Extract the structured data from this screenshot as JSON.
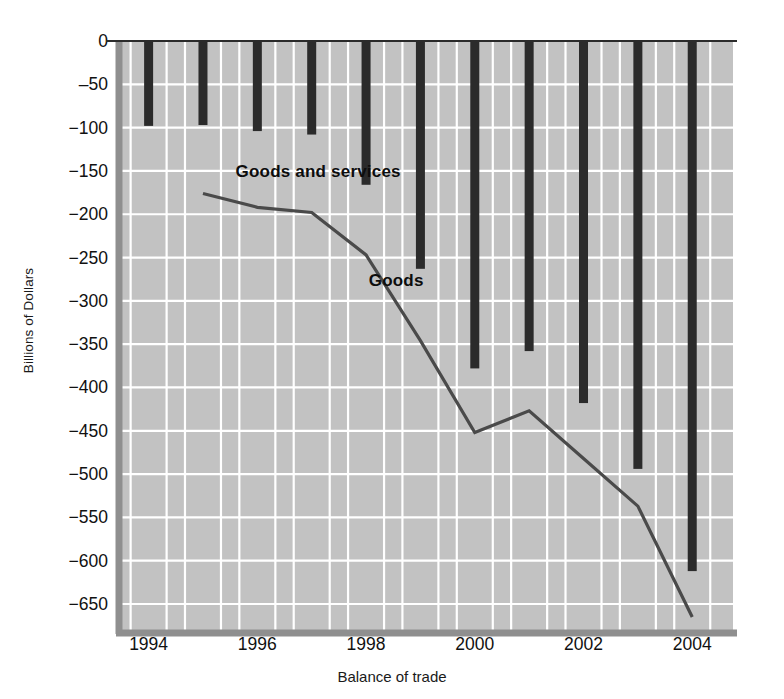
{
  "chart_data": {
    "type": "line",
    "title": "",
    "xlabel": "Balance of trade",
    "ylabel": "Billions of Dollars",
    "xlim": [
      1993.4,
      2004.75
    ],
    "ylim": [
      -680,
      0
    ],
    "xticks": [
      "1994",
      "1996",
      "1998",
      "2000",
      "2002",
      "2004"
    ],
    "xtick_values": [
      1994,
      1996,
      1998,
      2000,
      2002,
      2004
    ],
    "yticks": [
      "0",
      "‒50",
      "−100",
      "−150",
      "−200",
      "−250",
      "−300",
      "−350",
      "−400",
      "−450",
      "−500",
      "−550",
      "−600",
      "−650"
    ],
    "ytick_values": [
      0,
      -50,
      -100,
      -150,
      -200,
      -250,
      -300,
      -350,
      -400,
      -450,
      -500,
      -550,
      -600,
      -650
    ],
    "grid": true,
    "grid_color": "#ffffff",
    "plot_background": "#c2c2c2",
    "legend_position": "inline-annotations",
    "series": [
      {
        "name": "Goods and services",
        "render": "bar",
        "color": "#2b2b2b",
        "label_x": 1995.6,
        "label_y": -152,
        "x": [
          1994,
          1995,
          1996,
          1997,
          1998,
          1999,
          2000,
          2001,
          2002,
          2003,
          2004
        ],
        "values": [
          -98,
          -97,
          -104,
          -108,
          -166,
          -263,
          -378,
          -358,
          -418,
          -494,
          -612
        ]
      },
      {
        "name": "Goods",
        "render": "line",
        "color": "#4a4a4a",
        "label_x": 1998.05,
        "label_y": -278,
        "x": [
          1995,
          1996,
          1997,
          1998,
          1999,
          2000,
          2001,
          2002,
          2003,
          2004
        ],
        "values": [
          -176,
          -192,
          -198,
          -247,
          -346,
          -452,
          -427,
          -482,
          -537,
          -665
        ]
      }
    ]
  }
}
